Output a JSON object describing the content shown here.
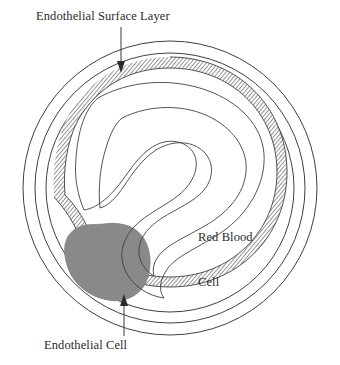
{
  "figure": {
    "background_color": "#ffffff",
    "stroke_color": "#3a3a3a",
    "hatch_color": "#8c8c8c",
    "endothelial_cell_fill": "#898989",
    "text_color": "#2b2b2b"
  },
  "labels": {
    "endothelial_surface_layer": "Endothelial Surface Layer",
    "endothelial_cell": "Endothelial Cell",
    "red_blood_cell_line1": "Red Blood",
    "red_blood_cell_line2": "Cell"
  },
  "annotations": {
    "esl_arrow": "arrow-down-icon",
    "ec_arrow": "arrow-up-icon"
  },
  "structures": {
    "outer_vessel_wall": "outer-circle",
    "middle_vessel_wall": "middle-circle",
    "inner_vessel_wall": "inner-circle",
    "endothelial_surface_layer": "hatched-band",
    "endothelial_cell": "gray-rounded-cell",
    "red_blood_cell_outline": "comma-shaped-outline",
    "red_blood_cell_inner": "nested-inner-contour"
  }
}
